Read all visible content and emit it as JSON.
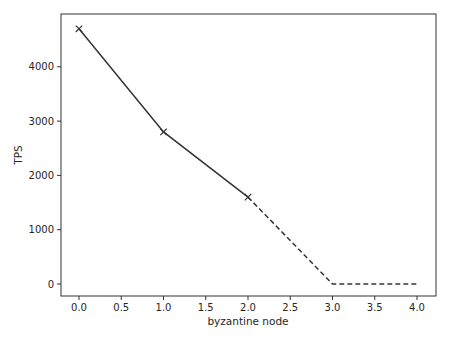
{
  "chart_data": {
    "type": "line",
    "title": "",
    "xlabel": "byzantine node",
    "ylabel": "TPS",
    "x": [
      0,
      1,
      2,
      3,
      4
    ],
    "series": [
      {
        "name": "measured",
        "style": "solid",
        "marker": "x",
        "x": [
          0,
          1,
          2
        ],
        "values": [
          4700,
          2800,
          1600
        ]
      },
      {
        "name": "projected",
        "style": "dashed",
        "marker": "none",
        "x": [
          2,
          3,
          4
        ],
        "values": [
          1600,
          0,
          0
        ]
      }
    ],
    "xlim": [
      -0.2,
      4.2
    ],
    "ylim": [
      -235,
      4950
    ],
    "xticks": [
      0.0,
      0.5,
      1.0,
      1.5,
      2.0,
      2.5,
      3.0,
      3.5,
      4.0
    ],
    "xtick_labels": [
      "0.0",
      "0.5",
      "1.0",
      "1.5",
      "2.0",
      "2.5",
      "3.0",
      "3.5",
      "4.0"
    ],
    "yticks": [
      0,
      1000,
      2000,
      3000,
      4000
    ],
    "ytick_labels": [
      "0",
      "1000",
      "2000",
      "3000",
      "4000"
    ],
    "grid": false,
    "legend": null,
    "line_color": "#333333"
  }
}
